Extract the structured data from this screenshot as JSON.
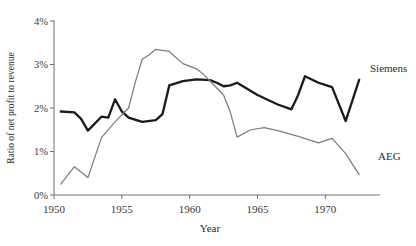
{
  "chart_data": {
    "type": "line",
    "title": "",
    "xlabel": "Year",
    "ylabel": "Ratio of net profit to revenue",
    "xlim": [
      1950,
      1973
    ],
    "ylim": [
      0,
      4
    ],
    "grid": false,
    "legend_position": "inline-right",
    "x_ticks": [
      1950,
      1955,
      1960,
      1965,
      1970
    ],
    "x_tick_labels": [
      "1950",
      "1955",
      "1960",
      "1965",
      "1970"
    ],
    "y_ticks": [
      0,
      1,
      2,
      3,
      4
    ],
    "y_tick_labels": [
      "0%",
      "1%",
      "2%",
      "3%",
      "4%"
    ],
    "series": [
      {
        "name": "Siemens",
        "color": "#1a1a1a",
        "x": [
          1950.5,
          1951.5,
          1952.0,
          1952.5,
          1953.5,
          1954.0,
          1954.5,
          1955.0,
          1955.5,
          1956.5,
          1957.5,
          1958.0,
          1958.5,
          1959.5,
          1960.5,
          1961.5,
          1962.0,
          1962.5,
          1963.0,
          1963.5,
          1965.0,
          1966.5,
          1967.5,
          1968.0,
          1968.5,
          1969.5,
          1970.5,
          1971.5,
          1972.5
        ],
        "values": [
          1.92,
          1.9,
          1.75,
          1.48,
          1.8,
          1.78,
          2.2,
          1.92,
          1.78,
          1.68,
          1.72,
          1.86,
          2.52,
          2.62,
          2.66,
          2.64,
          2.58,
          2.5,
          2.52,
          2.58,
          2.3,
          2.08,
          1.97,
          2.3,
          2.73,
          2.58,
          2.48,
          1.7,
          2.65
        ]
      },
      {
        "name": "AEG",
        "color": "#7d7d7d",
        "x": [
          1950.5,
          1951.5,
          1952.5,
          1953.5,
          1954.5,
          1955.5,
          1956.0,
          1956.5,
          1957.0,
          1957.5,
          1958.5,
          1959.5,
          1960.5,
          1961.0,
          1961.5,
          1962.5,
          1963.0,
          1963.5,
          1964.5,
          1965.5,
          1966.5,
          1968.0,
          1969.5,
          1970.5,
          1971.5,
          1972.5
        ],
        "values": [
          0.25,
          0.65,
          0.4,
          1.32,
          1.68,
          2.0,
          2.6,
          3.12,
          3.22,
          3.35,
          3.3,
          3.02,
          2.9,
          2.78,
          2.62,
          2.3,
          1.9,
          1.33,
          1.5,
          1.55,
          1.48,
          1.35,
          1.2,
          1.3,
          0.95,
          0.47
        ]
      }
    ]
  },
  "labels": {
    "siemens": "Siemens",
    "aeg": "AEG"
  }
}
